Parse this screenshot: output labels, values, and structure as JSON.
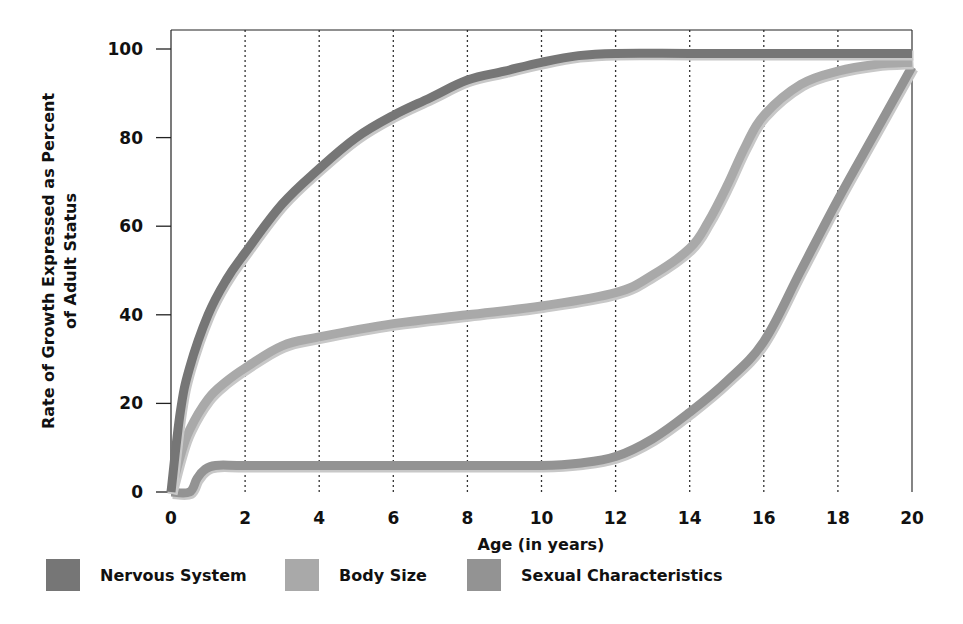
{
  "chart_data": {
    "type": "line",
    "title": "",
    "xlabel": "Age (in years)",
    "ylabel": "Rate of Growth Expressed as Percent of Adult Status",
    "ylabel_lines": [
      "Rate of Growth Expressed as Percent",
      "of Adult Status"
    ],
    "xlim": [
      0,
      20
    ],
    "ylim": [
      0,
      100
    ],
    "x_ticks": [
      0,
      2,
      4,
      6,
      8,
      10,
      12,
      14,
      16,
      18,
      20
    ],
    "y_ticks": [
      0,
      20,
      40,
      60,
      80,
      100
    ],
    "grid": "vertical dotted lines at x ticks",
    "legend_position": "bottom",
    "series": [
      {
        "name": "Nervous System",
        "color": "#767676",
        "x": [
          0,
          0.25,
          0.5,
          1,
          1.5,
          2,
          3,
          4,
          5,
          6,
          7,
          8,
          9,
          10,
          11,
          12,
          14,
          16,
          18,
          20
        ],
        "y": [
          0,
          18,
          28,
          40,
          48,
          54,
          65,
          73,
          80,
          85,
          89,
          93,
          95,
          97,
          98.5,
          99,
          99,
          99,
          99,
          99
        ]
      },
      {
        "name": "Body Size",
        "color": "#a9a9a9",
        "x": [
          0,
          0.25,
          0.5,
          1,
          1.5,
          2,
          3,
          4,
          6,
          8,
          10,
          12,
          13,
          14,
          14.5,
          15,
          15.5,
          16,
          17,
          18,
          19,
          20
        ],
        "y": [
          0,
          8,
          14,
          21,
          25,
          28,
          33,
          35,
          38,
          40,
          42,
          45,
          49,
          55,
          61,
          69,
          78,
          85,
          92,
          95,
          96.5,
          97
        ]
      },
      {
        "name": "Sexual Characteristics",
        "color": "#939393",
        "x": [
          0,
          0.5,
          0.7,
          0.9,
          1.2,
          2,
          4,
          6,
          8,
          10,
          11,
          12,
          13,
          14,
          15,
          16,
          17,
          18,
          19,
          20
        ],
        "y": [
          0,
          0,
          3,
          5,
          6,
          6,
          6,
          6,
          6,
          6,
          6.5,
          8,
          12,
          18,
          25,
          34,
          50,
          66,
          81,
          96
        ]
      }
    ]
  },
  "axes": {
    "x_title": "Age (in years)",
    "y_title_line1": "Rate of Growth Expressed as Percent",
    "y_title_line2": "of Adult Status"
  },
  "legend": {
    "items": [
      {
        "label": "Nervous System",
        "color": "#767676"
      },
      {
        "label": "Body Size",
        "color": "#a9a9a9"
      },
      {
        "label": "Sexual Characteristics",
        "color": "#939393"
      }
    ]
  }
}
